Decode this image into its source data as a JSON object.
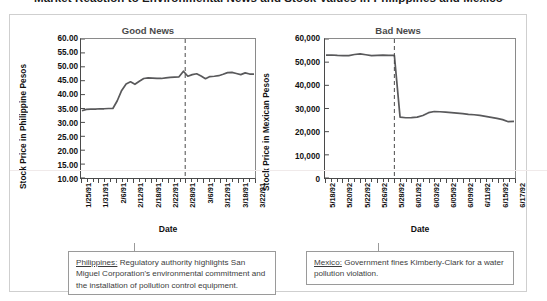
{
  "document": {
    "title": "Market Reaction to Environmental News and Stock Values in Philippines and Mexico",
    "bullet": "•"
  },
  "chart_data": [
    {
      "type": "line",
      "title": "Good News",
      "xlabel": "Date",
      "ylabel": "Stock Price in Philippine Pesos",
      "ylim": [
        10.0,
        60.0
      ],
      "ytick_labels": [
        "60.00",
        "55.00",
        "50.00",
        "45.00",
        "40.00",
        "35.00",
        "30.00",
        "25.00",
        "20.00",
        "15.00",
        "10.00"
      ],
      "ytick_values": [
        60.0,
        55.0,
        50.0,
        45.0,
        40.0,
        35.0,
        30.0,
        25.0,
        20.0,
        15.0,
        10.0
      ],
      "grid": false,
      "legend": "none",
      "event_line_label": "event",
      "event_index": 6,
      "categories": [
        "1/25/91",
        "1/31/91",
        "2/6/91",
        "2/12/91",
        "2/18/91",
        "2/22/91",
        "2/28/91",
        "3/6/91",
        "3/12/91",
        "3/18/91",
        "3/22/91"
      ],
      "x": [
        0,
        1,
        2,
        3,
        4,
        5,
        6,
        7,
        8,
        9,
        10,
        11,
        12,
        13,
        14,
        15,
        16,
        17,
        18,
        19,
        20,
        21,
        22,
        23,
        24,
        25,
        26,
        27,
        28,
        29,
        30,
        31,
        32,
        33,
        34,
        35,
        36,
        37,
        38,
        39
      ],
      "values": [
        34.2,
        34.7,
        34.8,
        34.8,
        34.9,
        34.9,
        35.0,
        35.0,
        37.8,
        41.5,
        43.8,
        44.6,
        43.7,
        44.8,
        45.8,
        46.0,
        45.9,
        45.8,
        45.8,
        46.0,
        46.2,
        46.3,
        46.4,
        48.4,
        46.6,
        47.2,
        47.5,
        46.7,
        45.7,
        46.5,
        46.6,
        46.8,
        47.3,
        47.9,
        48.0,
        47.6,
        47.2,
        47.8,
        47.4,
        47.4
      ]
    },
    {
      "type": "line",
      "title": "Bad News",
      "xlabel": "Date",
      "ylabel": "Stock Price in Mexican Pesos",
      "ylim": [
        0,
        60000
      ],
      "ytick_labels": [
        "60,000",
        "50,000",
        "40,000",
        "30,000",
        "20,000",
        "10,000",
        "0"
      ],
      "ytick_values": [
        60000,
        50000,
        40000,
        30000,
        20000,
        10000,
        0
      ],
      "grid": false,
      "legend": "none",
      "event_line_label": "event",
      "event_index": 4,
      "categories": [
        "5/18/92",
        "5/20/92",
        "5/22/92",
        "5/26/92",
        "5/28/92",
        "6/01/92",
        "6/03/92",
        "6/05/92",
        "6/09/92",
        "6/11/92",
        "6/15/92",
        "6/17/92"
      ],
      "x": [
        0,
        1,
        2,
        3,
        4,
        5,
        6,
        7,
        8,
        9,
        10,
        11,
        12,
        13,
        14,
        15,
        16,
        17,
        18,
        19,
        20,
        21,
        22,
        23,
        24,
        25,
        26,
        27,
        28,
        29,
        30,
        31,
        32,
        33
      ],
      "values": [
        53000,
        53100,
        52900,
        52800,
        52800,
        53300,
        53600,
        53200,
        52800,
        52900,
        53000,
        52900,
        52900,
        26300,
        26000,
        26100,
        26300,
        27000,
        28200,
        28700,
        28600,
        28400,
        28200,
        28000,
        27800,
        27500,
        27300,
        27000,
        26600,
        26200,
        25700,
        25200,
        24300,
        24400
      ]
    }
  ],
  "captions": {
    "philippines": {
      "lead": "Philippines:",
      "text": " Regulatory authority highlights San Miguel Corporation's environmental commitment and the installation of pollution control equipment."
    },
    "mexico": {
      "lead": "Mexico:",
      "text": " Government fines Kimberly-Clark for a water pollution violation."
    }
  }
}
